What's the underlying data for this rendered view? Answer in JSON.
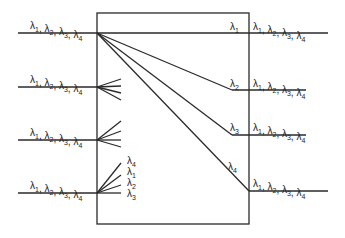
{
  "diagram": {
    "type": "wavelength-router",
    "input_ports": [
      {
        "id": 1,
        "label": "λ1, λ2, λ3, λ4"
      },
      {
        "id": 2,
        "label": "λ1, λ2, λ3, λ4"
      },
      {
        "id": 3,
        "label": "λ1, λ2, λ3, λ4"
      },
      {
        "id": 4,
        "label": "λ1, λ2, λ3, λ4"
      }
    ],
    "output_ports": [
      {
        "id": 1,
        "label": "λ1, λ2, λ3, λ4",
        "inner_label": "λ1"
      },
      {
        "id": 2,
        "label": "λ1, λ2, λ3, λ4",
        "inner_label": "λ2"
      },
      {
        "id": 3,
        "label": "λ1, λ2, λ3, λ4",
        "inner_label": "λ3"
      },
      {
        "id": 4,
        "label": "λ1, λ2, λ3, λ4",
        "inner_label": "λ4"
      }
    ],
    "port4_fanout_labels": [
      "λ4",
      "λ1",
      "λ2",
      "λ3"
    ]
  }
}
